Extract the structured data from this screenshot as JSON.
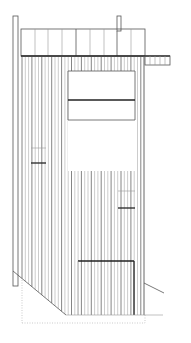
{
  "drawing": {
    "type": "architectural-elevation",
    "subject": "shed with vertical board siding",
    "colors": {
      "background": "#ffffff",
      "line_dark": "#222222",
      "line_mid": "#555555",
      "line_light": "#999999"
    },
    "width": 191,
    "height": 343
  }
}
